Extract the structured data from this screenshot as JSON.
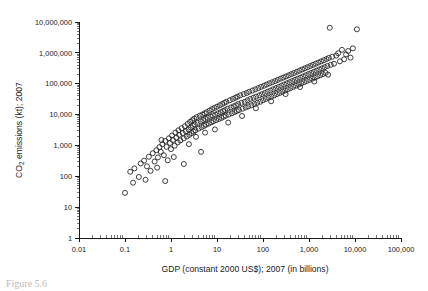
{
  "figure": {
    "caption_fragment": "Figure 5.6"
  },
  "chart_data": {
    "type": "scatter",
    "title": "",
    "xlabel": "GDP (constant 2000 US$); 2007 (in billions)",
    "ylabel": "CO2 emissions (kt); 2007",
    "ylabel_rich": "CO₂ emissions (kt); 2007",
    "xscale": "log",
    "yscale": "log",
    "xlim": [
      0.01,
      100000
    ],
    "ylim": [
      1,
      10000000
    ],
    "grid": false,
    "legend": null,
    "marker": "open-circle",
    "marker_color": "#1e1e1e",
    "xticks": [
      0.01,
      0.1,
      1,
      10,
      100,
      1000,
      10000,
      100000
    ],
    "xtick_labels": [
      "0.01",
      "0.1",
      "1",
      "10",
      "100",
      "1,000",
      "10,000",
      "100,000"
    ],
    "yticks": [
      1,
      10,
      100,
      1000,
      10000,
      100000,
      1000000,
      10000000
    ],
    "ytick_labels": [
      "1",
      "10",
      "100",
      "1,000",
      "10,000",
      "100,000",
      "1,000,000",
      "10,000,000"
    ],
    "minor_ticks": true,
    "n_points": 208,
    "points": [
      [
        0.1,
        29
      ],
      [
        0.13,
        140
      ],
      [
        0.16,
        180
      ],
      [
        0.2,
        95
      ],
      [
        0.22,
        260
      ],
      [
        0.26,
        320
      ],
      [
        0.3,
        210
      ],
      [
        0.33,
        430
      ],
      [
        0.36,
        150
      ],
      [
        0.4,
        560
      ],
      [
        0.44,
        300
      ],
      [
        0.48,
        700
      ],
      [
        0.52,
        410
      ],
      [
        0.56,
        880
      ],
      [
        0.6,
        620
      ],
      [
        0.65,
        1100
      ],
      [
        0.7,
        480
      ],
      [
        0.75,
        1400
      ],
      [
        0.8,
        900
      ],
      [
        0.85,
        330
      ],
      [
        0.9,
        1700
      ],
      [
        0.95,
        1200
      ],
      [
        1.0,
        760
      ],
      [
        1.05,
        2100
      ],
      [
        1.1,
        1500
      ],
      [
        1.2,
        980
      ],
      [
        1.25,
        2600
      ],
      [
        1.3,
        1800
      ],
      [
        1.4,
        1250
      ],
      [
        1.45,
        3100
      ],
      [
        1.5,
        2200
      ],
      [
        1.6,
        1450
      ],
      [
        1.7,
        3600
      ],
      [
        1.8,
        2500
      ],
      [
        1.9,
        1700
      ],
      [
        2.0,
        4200
      ],
      [
        2.1,
        2900
      ],
      [
        2.2,
        1950
      ],
      [
        2.3,
        5000
      ],
      [
        2.4,
        3300
      ],
      [
        2.5,
        2200
      ],
      [
        2.6,
        5800
      ],
      [
        2.7,
        3800
      ],
      [
        2.8,
        2500
      ],
      [
        2.9,
        6600
      ],
      [
        3.0,
        4300
      ],
      [
        3.1,
        2800
      ],
      [
        3.2,
        7400
      ],
      [
        3.3,
        4800
      ],
      [
        3.4,
        3100
      ],
      [
        3.6,
        8300
      ],
      [
        3.8,
        5400
      ],
      [
        4.0,
        3500
      ],
      [
        4.2,
        9200
      ],
      [
        4.4,
        6000
      ],
      [
        4.6,
        3900
      ],
      [
        4.8,
        10000
      ],
      [
        5.0,
        6600
      ],
      [
        5.2,
        4300
      ],
      [
        5.4,
        11000
      ],
      [
        5.6,
        7200
      ],
      [
        5.8,
        4700
      ],
      [
        6.0,
        12000
      ],
      [
        6.3,
        7900
      ],
      [
        6.6,
        5100
      ],
      [
        6.9,
        13500
      ],
      [
        7.2,
        8600
      ],
      [
        7.5,
        5600
      ],
      [
        7.8,
        15000
      ],
      [
        8.1,
        9400
      ],
      [
        8.4,
        6100
      ],
      [
        8.8,
        16500
      ],
      [
        9.2,
        10000
      ],
      [
        9.6,
        6600
      ],
      [
        10.0,
        18000
      ],
      [
        10.5,
        11000
      ],
      [
        11.0,
        7200
      ],
      [
        11.5,
        20000
      ],
      [
        12.0,
        12000
      ],
      [
        12.5,
        7800
      ],
      [
        13.0,
        22000
      ],
      [
        13.5,
        13000
      ],
      [
        14.0,
        8500
      ],
      [
        14.5,
        24000
      ],
      [
        15.0,
        14000
      ],
      [
        15.5,
        9200
      ],
      [
        16.0,
        26000
      ],
      [
        17.0,
        15500
      ],
      [
        18.0,
        10000
      ],
      [
        19.0,
        29000
      ],
      [
        20.0,
        17000
      ],
      [
        21.0,
        11000
      ],
      [
        22.0,
        32000
      ],
      [
        23.0,
        18500
      ],
      [
        24.0,
        12000
      ],
      [
        25.0,
        35000
      ],
      [
        26.0,
        20000
      ],
      [
        27.0,
        13000
      ],
      [
        28.0,
        38000
      ],
      [
        29.0,
        22000
      ],
      [
        30.0,
        14000
      ],
      [
        32.0,
        42000
      ],
      [
        34.0,
        24000
      ],
      [
        36.0,
        15500
      ],
      [
        38.0,
        46000
      ],
      [
        40.0,
        26000
      ],
      [
        42.0,
        17000
      ],
      [
        44.0,
        50000
      ],
      [
        46.0,
        29000
      ],
      [
        48.0,
        18500
      ],
      [
        50.0,
        55000
      ],
      [
        53.0,
        32000
      ],
      [
        56.0,
        20000
      ],
      [
        59.0,
        60000
      ],
      [
        62.0,
        35000
      ],
      [
        65.0,
        22000
      ],
      [
        68.0,
        66000
      ],
      [
        71.0,
        38000
      ],
      [
        75.0,
        24000
      ],
      [
        79.0,
        72000
      ],
      [
        83.0,
        42000
      ],
      [
        87.0,
        26000
      ],
      [
        91.0,
        79000
      ],
      [
        95.0,
        46000
      ],
      [
        100.0,
        29000
      ],
      [
        105.0,
        86000
      ],
      [
        110.0,
        50000
      ],
      [
        115.0,
        32000
      ],
      [
        120.0,
        94000
      ],
      [
        126.0,
        55000
      ],
      [
        132.0,
        35000
      ],
      [
        138.0,
        103000
      ],
      [
        145.0,
        60000
      ],
      [
        152.0,
        38000
      ],
      [
        159.0,
        112000
      ],
      [
        167.0,
        66000
      ],
      [
        175.0,
        42000
      ],
      [
        183.0,
        122000
      ],
      [
        192.0,
        72000
      ],
      [
        201.0,
        46000
      ],
      [
        210.0,
        133000
      ],
      [
        220.0,
        79000
      ],
      [
        230.0,
        50000
      ],
      [
        241.0,
        145000
      ],
      [
        252.0,
        86000
      ],
      [
        264.0,
        55000
      ],
      [
        276.0,
        158000
      ],
      [
        289.0,
        94000
      ],
      [
        302.0,
        60000
      ],
      [
        316.0,
        172000
      ],
      [
        331.0,
        103000
      ],
      [
        346.0,
        66000
      ],
      [
        362.0,
        188000
      ],
      [
        379.0,
        112000
      ],
      [
        396.0,
        72000
      ],
      [
        414.0,
        205000
      ],
      [
        433.0,
        122000
      ],
      [
        453.0,
        79000
      ],
      [
        474.0,
        223000
      ],
      [
        496.0,
        133000
      ],
      [
        519.0,
        86000
      ],
      [
        543.0,
        243000
      ],
      [
        568.0,
        145000
      ],
      [
        594.0,
        94000
      ],
      [
        621.0,
        265000
      ],
      [
        650.0,
        158000
      ],
      [
        680.0,
        103000
      ],
      [
        711.0,
        289000
      ],
      [
        744.0,
        172000
      ],
      [
        778.0,
        112000
      ],
      [
        814.0,
        315000
      ],
      [
        851.0,
        188000
      ],
      [
        890.0,
        122000
      ],
      [
        931.0,
        343000
      ],
      [
        974.0,
        205000
      ],
      [
        1019.0,
        133000
      ],
      [
        1066.0,
        374000
      ],
      [
        1115.0,
        223000
      ],
      [
        1166.0,
        145000
      ],
      [
        1220.0,
        408000
      ],
      [
        1276.0,
        243000
      ],
      [
        1335.0,
        158000
      ],
      [
        1397.0,
        445000
      ],
      [
        1461.0,
        265000
      ],
      [
        1529.0,
        172000
      ],
      [
        1600.0,
        485000
      ],
      [
        1674.0,
        289000
      ],
      [
        1751.0,
        188000
      ],
      [
        1832.0,
        529000
      ],
      [
        1917.0,
        315000
      ],
      [
        2005.0,
        205000
      ],
      [
        2098.0,
        577000
      ],
      [
        2195.0,
        343000
      ],
      [
        2297.0,
        224000
      ],
      [
        2403.0,
        629000
      ],
      [
        2515.0,
        374000
      ],
      [
        2700.0,
        686000
      ],
      [
        2830.0,
        6500000
      ],
      [
        2960.0,
        408000
      ],
      [
        3200.0,
        748000
      ],
      [
        3500.0,
        445000
      ],
      [
        3900.0,
        816000
      ],
      [
        4300.0,
        970000
      ],
      [
        4700.0,
        530000
      ],
      [
        5200.0,
        1250000
      ],
      [
        5800.0,
        620000
      ],
      [
        6400.0,
        890000
      ],
      [
        7100.0,
        1150000
      ],
      [
        8000.0,
        700000
      ],
      [
        9000.0,
        1400000
      ],
      [
        11000.0,
        5800000
      ],
      [
        0.15,
        62
      ],
      [
        0.28,
        77
      ],
      [
        0.5,
        190
      ],
      [
        0.62,
        1500
      ],
      [
        1.15,
        420
      ],
      [
        2.45,
        1100
      ],
      [
        3.5,
        1900
      ],
      [
        5.5,
        2600
      ],
      [
        9.0,
        3300
      ],
      [
        17.5,
        5500
      ],
      [
        35.0,
        9000
      ],
      [
        70.0,
        16000
      ],
      [
        150.0,
        27000
      ],
      [
        310.0,
        46000
      ],
      [
        640.0,
        78000
      ],
      [
        1300.0,
        118000
      ],
      [
        2600.0,
        196000
      ],
      [
        0.75,
        70
      ],
      [
        1.9,
        250
      ],
      [
        4.5,
        620
      ]
    ]
  }
}
